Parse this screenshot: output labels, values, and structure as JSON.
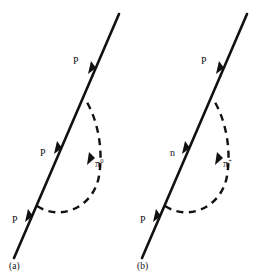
{
  "figure": {
    "type": "particle-interaction-diagrams",
    "background_color": "#ffffff",
    "line_color": "#111111",
    "panels": [
      {
        "id": "a",
        "caption": "(a)",
        "labels": {
          "top": "P",
          "middle": "P",
          "bottom": "P",
          "meson_symbol": "π",
          "meson_charge": "0"
        }
      },
      {
        "id": "b",
        "caption": "(b)",
        "labels": {
          "top": "P",
          "middle": "n",
          "bottom": "P",
          "meson_symbol": "π",
          "meson_charge": "+"
        }
      }
    ]
  }
}
